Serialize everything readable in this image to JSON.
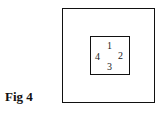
{
  "figure": {
    "caption": "Fig 4",
    "outer_square": {
      "label": ""
    },
    "inner_square": {
      "labels": {
        "top": "1",
        "right": "2",
        "bottom": "3",
        "left": "4"
      }
    }
  }
}
